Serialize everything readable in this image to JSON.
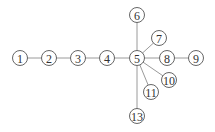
{
  "diagram": {
    "type": "tree-graph",
    "nodes": [
      {
        "id": "1",
        "label": "1",
        "x": 20,
        "y": 58
      },
      {
        "id": "2",
        "label": "2",
        "x": 49,
        "y": 58
      },
      {
        "id": "3",
        "label": "3",
        "x": 78,
        "y": 58
      },
      {
        "id": "4",
        "label": "4",
        "x": 107,
        "y": 58
      },
      {
        "id": "5",
        "label": "5",
        "x": 137,
        "y": 58
      },
      {
        "id": "6",
        "label": "6",
        "x": 137,
        "y": 15
      },
      {
        "id": "7",
        "label": "7",
        "x": 159,
        "y": 38
      },
      {
        "id": "8",
        "label": "8",
        "x": 167,
        "y": 58
      },
      {
        "id": "9",
        "label": "9",
        "x": 196,
        "y": 58
      },
      {
        "id": "10",
        "label": "10",
        "x": 169,
        "y": 80
      },
      {
        "id": "11",
        "label": "11",
        "x": 151,
        "y": 92
      },
      {
        "id": "13",
        "label": "13",
        "x": 137,
        "y": 116
      }
    ],
    "edges": [
      [
        "1",
        "2"
      ],
      [
        "2",
        "3"
      ],
      [
        "3",
        "4"
      ],
      [
        "4",
        "5"
      ],
      [
        "5",
        "6"
      ],
      [
        "5",
        "7"
      ],
      [
        "5",
        "8"
      ],
      [
        "8",
        "9"
      ],
      [
        "5",
        "10"
      ],
      [
        "5",
        "11"
      ],
      [
        "5",
        "13"
      ]
    ],
    "colors": {
      "edge": "#9a9a9a",
      "node_stroke": "#555555",
      "text": "#333333"
    }
  }
}
